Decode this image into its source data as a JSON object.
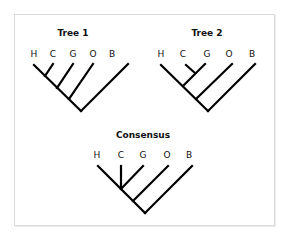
{
  "trees": [
    {
      "title": "Tree 1",
      "leaves": [
        "H",
        "C",
        "G",
        "O",
        "B"
      ],
      "topology": "((((H,C),G),O),B)"
    },
    {
      "title": "Tree 2",
      "leaves": [
        "H",
        "C",
        "G",
        "O",
        "B"
      ],
      "topology": "(((H,(C,G)),O),B)"
    },
    {
      "title": "Consensus",
      "leaves": [
        "H",
        "C",
        "G",
        "O",
        "B"
      ],
      "topology": "(((H,C,G),O),B)"
    }
  ],
  "colors": {
    "line": "#000000",
    "text": "#111111",
    "frame": "#d9d9d9"
  }
}
